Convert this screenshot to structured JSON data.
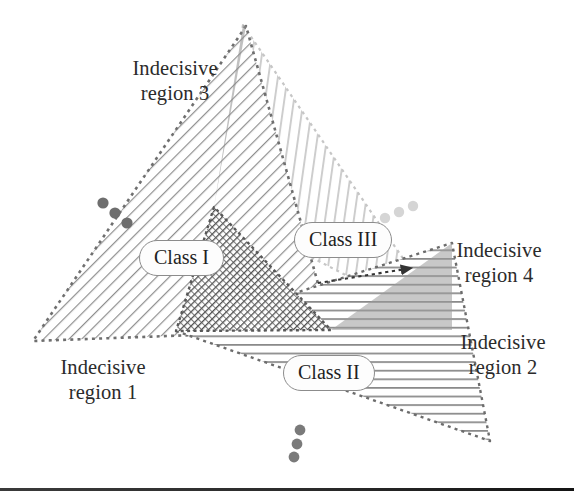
{
  "figure": {
    "title_present": false,
    "background_color": "#ffffff",
    "bottom_rule": {
      "present": true,
      "y": 488,
      "color": "#232323"
    }
  },
  "labels": {
    "region1": "Indecisive\nregion 1",
    "region2": "Indecisive\nregion 2",
    "region3": "Indecisive\nregion 3",
    "region4": "Indecisive\nregion 4",
    "class1": "Class I",
    "class2": "Class II",
    "class3": "Class III"
  },
  "regions": [
    {
      "name": "Class I",
      "hatch": "diagonal-down-right",
      "hatch_color": "#8f8f8f",
      "boundary_style": "dotted",
      "boundary_color": "#707070",
      "vertices": [
        [
          246,
          26
        ],
        [
          33,
          341
        ],
        [
          331,
          330
        ]
      ]
    },
    {
      "name": "Class II",
      "hatch": "horizontal",
      "hatch_color": "#8a8a8a",
      "boundary_style": "dotted",
      "boundary_color": "#6e6e6e",
      "vertices": [
        [
          176,
          331
        ],
        [
          490,
          441
        ],
        [
          452,
          243
        ]
      ]
    },
    {
      "name": "Class III",
      "hatch": "vertical",
      "hatch_color": "#cfcfcf",
      "boundary_style": "dotted",
      "boundary_color": "#bdbdbd",
      "vertices": [
        [
          243,
          25
        ],
        [
          452,
          330
        ],
        [
          214,
          207
        ]
      ]
    }
  ],
  "overlap_region": {
    "name": "Indecisive region 4",
    "description": "dark triangular overlap of all three class regions",
    "vertices": [
      [
        214,
        207
      ],
      [
        176,
        331
      ],
      [
        331,
        330
      ]
    ],
    "color": "#5e5e5e"
  },
  "annotation_arrow": {
    "style": "dotted",
    "from": [
      318,
      283
    ],
    "to": [
      415,
      268
    ],
    "color": "#3a3a3a",
    "points_to": "Indecisive region 4"
  },
  "ellipsis_marks": [
    {
      "name": "left-ellipsis",
      "color": "#6e6e6e",
      "dots": [
        [
          103,
          203
        ],
        [
          115,
          213
        ],
        [
          127,
          223
        ]
      ]
    },
    {
      "name": "right-ellipsis",
      "color": "#d2d2d2",
      "dots": [
        [
          385,
          218
        ],
        [
          399,
          212
        ],
        [
          413,
          206
        ]
      ]
    },
    {
      "name": "bottom-ellipsis",
      "color": "#7a7a7a",
      "dots": [
        [
          300,
          430
        ],
        [
          297,
          444
        ],
        [
          294,
          457
        ]
      ]
    }
  ],
  "colors": {
    "text": "#2b2b2b",
    "pill_border": "#8c8c8c",
    "pill_fill": "#fdfdfd",
    "hatch_dark": "#8f8f8f",
    "hatch_light": "#cfcfcf",
    "overlap": "#5e5e5e"
  }
}
